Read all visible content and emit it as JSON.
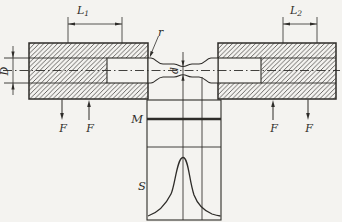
{
  "figure": {
    "kind": "engineering-line-drawing",
    "ink_color": "#2e2c29",
    "background_color": "#f4f3f0"
  },
  "labels": {
    "L1_main": "L",
    "L1_sub": "1",
    "L2_main": "L",
    "L2_sub": "2",
    "D": "D",
    "d": "d",
    "r": "r",
    "F": "F",
    "M": "M",
    "S": "S"
  }
}
